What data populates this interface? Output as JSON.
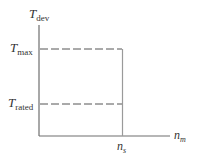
{
  "diagram": {
    "type": "torque-speed characteristic",
    "y_axis": {
      "label_main": "T",
      "label_sub": "dev"
    },
    "x_axis": {
      "label_main": "n",
      "label_sub": "m"
    },
    "levels": [
      {
        "label_main": "T",
        "label_sub": "max"
      },
      {
        "label_main": "T",
        "label_sub": "rated"
      }
    ],
    "marker": {
      "label_main": "n",
      "label_sub": "s"
    },
    "colors": {
      "axis": "#6e6e6e",
      "dashed": "#555555",
      "text": "#333333"
    }
  }
}
